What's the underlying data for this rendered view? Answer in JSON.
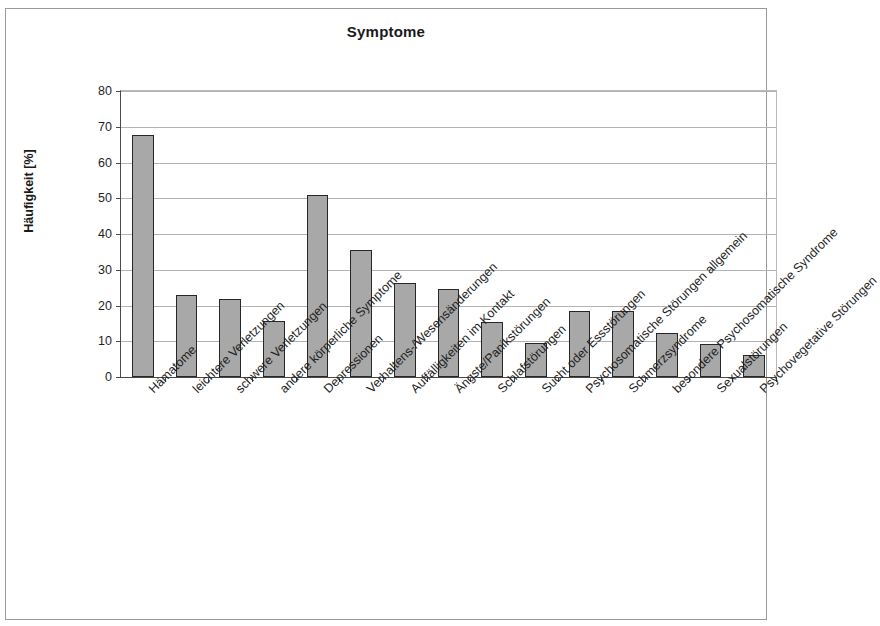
{
  "chart_data": {
    "type": "bar",
    "title": "Symptome",
    "xlabel": "",
    "ylabel": "Häufigkeit [%]",
    "ylim": [
      0,
      80
    ],
    "ytick_step": 10,
    "yticks": [
      80,
      70,
      60,
      50,
      40,
      30,
      20,
      10,
      0
    ],
    "grid": true,
    "legend": null,
    "bar_color": "#a8a8a8",
    "bar_edge_color": "#272727",
    "categories": [
      "Hämatome",
      "leichtere Verletzungen",
      "schwere Verletzungen",
      "andere körperliche Symptome",
      "Depressionen",
      "Verhaltens-/Wesensänderungen",
      "Auffälligkeiten im Kontakt",
      "Ängste/Panikstörungen",
      "Schlafstörungen",
      "Sucht oder Essstörungen",
      "Psychosomatische Störungen allgemein",
      "Schmerzsyndrome",
      "besondere Psychosomatische Syndrome",
      "Sexualstörungen",
      "Psychovegetative Störungen"
    ],
    "values": [
      67.7,
      23.0,
      21.7,
      15.6,
      51.0,
      35.6,
      26.2,
      24.5,
      15.5,
      9.5,
      18.4,
      18.4,
      12.2,
      9.2,
      6.1
    ]
  }
}
